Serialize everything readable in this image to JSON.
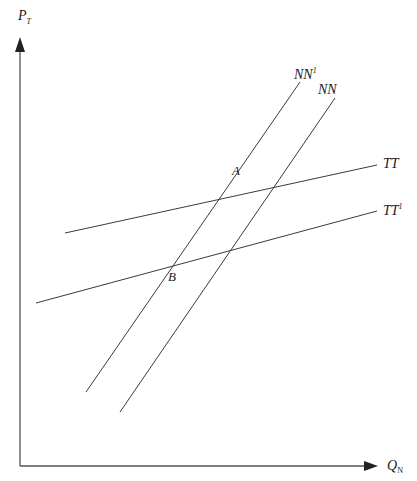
{
  "diagram": {
    "type": "economics-supply-demand-shift",
    "axes": {
      "y_label": {
        "main": "P",
        "sub": "T"
      },
      "x_label": {
        "main": "Q",
        "sub": "N"
      }
    },
    "curves": [
      {
        "id": "NN1",
        "label": "NN",
        "superscript": "1",
        "from": [
          86,
          392
        ],
        "to": [
          300,
          82
        ]
      },
      {
        "id": "NN",
        "label": "NN",
        "superscript": "",
        "from": [
          120,
          412
        ],
        "to": [
          335,
          98
        ]
      },
      {
        "id": "TT",
        "label": "TT",
        "superscript": "",
        "from": [
          65,
          233
        ],
        "to": [
          377,
          165
        ]
      },
      {
        "id": "TT1",
        "label": "TT",
        "superscript": "1",
        "from": [
          36,
          303
        ],
        "to": [
          377,
          211
        ]
      }
    ],
    "points": [
      {
        "id": "A",
        "label": "A"
      },
      {
        "id": "B",
        "label": "B"
      }
    ]
  }
}
